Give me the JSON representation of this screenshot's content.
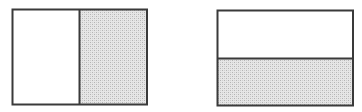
{
  "figure": {
    "colors": {
      "stroke": "#3a3a3a",
      "fill_empty": "#ffffff",
      "shade_light": "#e4e4e4",
      "shade_dark": "#b8b8b8"
    },
    "shapes": [
      {
        "id": "left-rectangle",
        "division": "vertical",
        "parts": 2,
        "shaded_parts": [
          "right"
        ],
        "shaded_fraction": 0.5
      },
      {
        "id": "right-rectangle",
        "division": "horizontal",
        "parts": 2,
        "shaded_parts": [
          "bottom"
        ],
        "shaded_fraction": 0.5
      }
    ]
  }
}
